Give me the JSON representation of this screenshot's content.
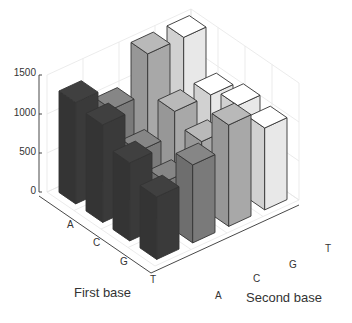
{
  "chart_data": {
    "type": "bar3d",
    "title": "",
    "xlabel": "First base",
    "ylabel": "Second base",
    "zlabel": "",
    "first_base": [
      "A",
      "C",
      "G",
      "T"
    ],
    "second_base": [
      "A",
      "C",
      "G",
      "T"
    ],
    "zticks": [
      0,
      500,
      1000,
      1500
    ],
    "zlim": [
      0,
      1500
    ],
    "grid": true,
    "series": [
      {
        "name": "A",
        "color": "#3a3a3a",
        "values": [
          1300,
          1250,
          1000,
          800
        ]
      },
      {
        "name": "C",
        "color": "#7a7a7a",
        "values": [
          1000,
          700,
          550,
          1000
        ]
      },
      {
        "name": "G",
        "color": "#a8a8a8",
        "values": [
          1500,
          1000,
          850,
          1300
        ]
      },
      {
        "name": "T",
        "color": "#e8e8e8",
        "values": [
          1500,
          1000,
          1100,
          1050
        ]
      }
    ]
  },
  "labels": {
    "first_base_title": "First base",
    "second_base_title": "Second base",
    "z_tick_labels": [
      "0",
      "500",
      "1000",
      "1500"
    ],
    "first_base_ticks": [
      "A",
      "C",
      "G",
      "T"
    ],
    "second_base_ticks": [
      "A",
      "C",
      "G",
      "T"
    ]
  }
}
